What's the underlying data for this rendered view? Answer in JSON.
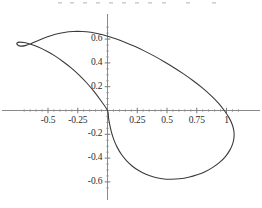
{
  "figure": {
    "title": "",
    "background_color": "#ffffff",
    "curve_color": "#3a3a3a",
    "axis_color": "#8a8a8a",
    "label_color": "#2b2b2b"
  },
  "chart_data": {
    "type": "line",
    "title": "",
    "subtitle": "",
    "xlabel": "",
    "ylabel": "",
    "grid": false,
    "legend": null,
    "legend_position": "none",
    "closed_curve": true,
    "xlim": [
      -0.9,
      1.3
    ],
    "ylim": [
      -0.72,
      0.78
    ],
    "xticks": [
      -0.5,
      -0.25,
      0.25,
      0.5,
      0.75,
      1
    ],
    "xtick_labels": [
      "-0.5",
      "-0.25",
      "0.25",
      "0.5",
      "0.75",
      "1"
    ],
    "yticks": [
      0.6,
      0.4,
      0.2,
      -0.2,
      -0.4,
      -0.6
    ],
    "ytick_labels": [
      "0.6",
      "0.4",
      "0.2",
      "-0.2",
      "-0.4",
      "-0.6"
    ],
    "minor_xticks": [
      -0.7,
      -0.65,
      -0.6,
      -0.55,
      -0.45,
      -0.4,
      -0.35,
      -0.3,
      -0.2,
      -0.15,
      -0.1,
      -0.05,
      0.05,
      0.1,
      0.15,
      0.2,
      0.3,
      0.35,
      0.4,
      0.45,
      0.55,
      0.6,
      0.65,
      0.7,
      0.8,
      0.85,
      0.9,
      0.95,
      1.05,
      1.1
    ],
    "minor_yticks": [
      0.7,
      0.65,
      0.55,
      0.5,
      0.45,
      0.35,
      0.3,
      0.25,
      0.15,
      0.1,
      0.05,
      -0.05,
      -0.1,
      -0.15,
      -0.25,
      -0.3,
      -0.35,
      -0.45,
      -0.5,
      -0.55,
      -0.65
    ],
    "annotations": [],
    "series": [
      {
        "name": "loop",
        "points": [
          [
            0.0,
            0.0
          ],
          [
            -0.055,
            0.082
          ],
          [
            -0.112,
            0.158
          ],
          [
            -0.172,
            0.229
          ],
          [
            -0.236,
            0.295
          ],
          [
            -0.303,
            0.356
          ],
          [
            -0.372,
            0.41
          ],
          [
            -0.442,
            0.459
          ],
          [
            -0.513,
            0.5
          ],
          [
            -0.582,
            0.533
          ],
          [
            -0.646,
            0.557
          ],
          [
            -0.7,
            0.571
          ],
          [
            -0.74,
            0.575
          ],
          [
            -0.758,
            0.57
          ],
          [
            -0.762,
            0.561
          ],
          [
            -0.752,
            0.549
          ],
          [
            -0.73,
            0.541
          ],
          [
            -0.692,
            0.545
          ],
          [
            -0.64,
            0.563
          ],
          [
            -0.578,
            0.59
          ],
          [
            -0.51,
            0.617
          ],
          [
            -0.438,
            0.64
          ],
          [
            -0.364,
            0.656
          ],
          [
            -0.289,
            0.664
          ],
          [
            -0.214,
            0.664
          ],
          [
            -0.14,
            0.657
          ],
          [
            -0.068,
            0.643
          ],
          [
            0.003,
            0.624
          ],
          [
            0.075,
            0.6
          ],
          [
            0.15,
            0.572
          ],
          [
            0.228,
            0.539
          ],
          [
            0.308,
            0.501
          ],
          [
            0.39,
            0.459
          ],
          [
            0.473,
            0.412
          ],
          [
            0.556,
            0.362
          ],
          [
            0.639,
            0.308
          ],
          [
            0.72,
            0.25
          ],
          [
            0.797,
            0.19
          ],
          [
            0.868,
            0.127
          ],
          [
            0.932,
            0.062
          ],
          [
            0.983,
            -0.002
          ],
          [
            1.022,
            -0.062
          ],
          [
            1.048,
            -0.118
          ],
          [
            1.062,
            -0.172
          ],
          [
            1.063,
            -0.227
          ],
          [
            1.051,
            -0.282
          ],
          [
            1.027,
            -0.335
          ],
          [
            0.991,
            -0.387
          ],
          [
            0.944,
            -0.434
          ],
          [
            0.888,
            -0.476
          ],
          [
            0.824,
            -0.512
          ],
          [
            0.754,
            -0.54
          ],
          [
            0.681,
            -0.561
          ],
          [
            0.606,
            -0.574
          ],
          [
            0.532,
            -0.578
          ],
          [
            0.459,
            -0.573
          ],
          [
            0.389,
            -0.559
          ],
          [
            0.323,
            -0.536
          ],
          [
            0.262,
            -0.505
          ],
          [
            0.207,
            -0.466
          ],
          [
            0.159,
            -0.421
          ],
          [
            0.118,
            -0.37
          ],
          [
            0.084,
            -0.314
          ],
          [
            0.057,
            -0.255
          ],
          [
            0.036,
            -0.193
          ],
          [
            0.021,
            -0.13
          ],
          [
            0.009,
            -0.066
          ],
          [
            0.0,
            0.0
          ]
        ]
      }
    ]
  },
  "axes": {
    "x_axis_name": "horizontal-axis",
    "y_axis_name": "vertical-axis"
  }
}
